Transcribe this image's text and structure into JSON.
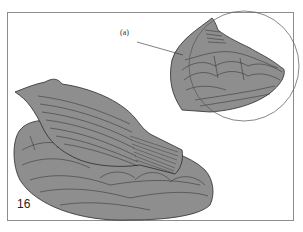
{
  "figure": {
    "number": "16",
    "callout_label": "(a)",
    "colors": {
      "fill": "#8e8e8e",
      "outline": "#2b2b2b",
      "frame": "#8c8c8c",
      "background": "#ffffff"
    }
  }
}
